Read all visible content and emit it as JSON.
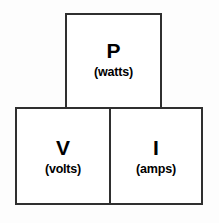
{
  "diagram": {
    "colors": {
      "border": "#2f2f2f",
      "text": "#000000",
      "cell_fill": "#ffffff",
      "background": "#fdfdfd"
    },
    "cells": {
      "top": {
        "symbol": "P",
        "unit": "(watts)",
        "quantity": "power"
      },
      "bottom_left": {
        "symbol": "V",
        "unit": "(volts)",
        "quantity": "voltage"
      },
      "bottom_right": {
        "symbol": "I",
        "unit": "(amps)",
        "quantity": "current"
      }
    }
  }
}
